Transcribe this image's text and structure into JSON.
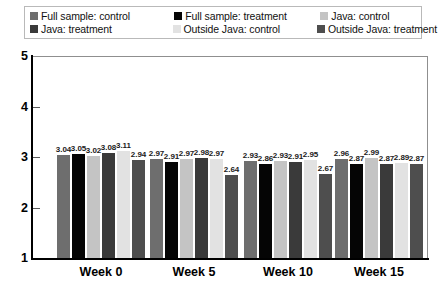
{
  "chart_data": {
    "type": "bar",
    "title": "",
    "subtitle": "",
    "xlabel": "",
    "ylabel": "",
    "categories": [
      "Week 0",
      "Week 5",
      "Week 10",
      "Week 15"
    ],
    "ylim": [
      1,
      5
    ],
    "yticks": [
      "1",
      "2",
      "3",
      "4",
      "5"
    ],
    "grid": false,
    "legend_position": "top",
    "bar_baseline": 1,
    "series": [
      {
        "name": "Full sample: control",
        "color": "#6e6e6e",
        "values": [
          3.04,
          2.97,
          2.93,
          2.96
        ],
        "labels": [
          "3.04",
          "2.97",
          "2.93",
          "2.96"
        ]
      },
      {
        "name": "Full sample: treatment",
        "color": "#050505",
        "values": [
          3.05,
          2.91,
          2.86,
          2.87
        ],
        "labels": [
          "3.05",
          "2.91",
          "2.86",
          "2.87"
        ]
      },
      {
        "name": "Java: control",
        "color": "#c4c4c4",
        "values": [
          3.02,
          2.97,
          2.93,
          2.99
        ],
        "labels": [
          "3.02",
          "2.97",
          "2.93",
          "2.99"
        ]
      },
      {
        "name": "Java: treatment",
        "color": "#3a3a3a",
        "values": [
          3.08,
          2.98,
          2.91,
          2.87
        ],
        "labels": [
          "3.08",
          "2.98",
          "2.91",
          "2.87"
        ]
      },
      {
        "name": "Outside Java: control",
        "color": "#e2e2e2",
        "values": [
          3.11,
          2.97,
          2.95,
          2.89
        ],
        "labels": [
          "3.11",
          "2.97",
          "2.95",
          "2.89"
        ]
      },
      {
        "name": "Outside Java: treatment",
        "color": "#4e4e4e",
        "values": [
          2.94,
          2.64,
          2.67,
          2.87
        ],
        "labels": [
          "2.94",
          "2.64",
          "2.67",
          "2.87"
        ]
      }
    ]
  },
  "legend": {
    "rows": [
      [
        {
          "label": "Full sample: control",
          "color": "#6e6e6e"
        },
        {
          "label": "Full sample: treatment",
          "color": "#050505"
        },
        {
          "label": "Java: control",
          "color": "#c4c4c4"
        }
      ],
      [
        {
          "label": "Java: treatment",
          "color": "#3a3a3a"
        },
        {
          "label": "Outside Java: control",
          "color": "#e2e2e2"
        },
        {
          "label": "Outside Java: treatment",
          "color": "#4e4e4e"
        }
      ]
    ]
  },
  "axes": {
    "y_ticks": [
      "5",
      "4",
      "3",
      "2",
      "1"
    ],
    "x_categories": [
      "Week 0",
      "Week 5",
      "Week 10",
      "Week 15"
    ]
  },
  "colors": {
    "axis": "#000000",
    "frame": "#8f8f8f",
    "background": "#ffffff",
    "text": "#111111"
  }
}
